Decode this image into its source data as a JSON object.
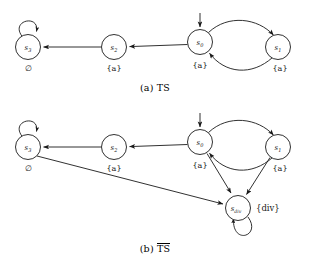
{
  "figure": {
    "title_a": "(a) TS",
    "caption_b_prefix": "(b) ",
    "caption_b_overlined": "TS",
    "stroke_color": "#1a1a1a",
    "background": "#ffffff"
  },
  "diagram_a": {
    "name": "TS",
    "caption": "(a) TS",
    "initial_state": "s0",
    "nodes": [
      {
        "id": "s3",
        "label_base": "s",
        "label_sub": "3",
        "ap": "∅",
        "ap_type": "emptyset",
        "cx": 28,
        "cy": 47,
        "r": 12.5
      },
      {
        "id": "s2",
        "label_base": "s",
        "label_sub": "2",
        "ap": "{a}",
        "ap_type": "set",
        "cx": 114,
        "cy": 47,
        "r": 12.5
      },
      {
        "id": "s0",
        "label_base": "s",
        "label_sub": "0",
        "ap": "{a}",
        "ap_type": "set",
        "cx": 200,
        "cy": 42,
        "r": 12.5
      },
      {
        "id": "s1",
        "label_base": "s",
        "label_sub": "1",
        "ap": "{a}",
        "ap_type": "set",
        "cx": 278,
        "cy": 47,
        "r": 12.5
      }
    ],
    "edges": [
      {
        "from": "s3",
        "to": "s3",
        "kind": "self-loop-top"
      },
      {
        "from": "s2",
        "to": "s3",
        "kind": "straight"
      },
      {
        "from": "s0",
        "to": "s2",
        "kind": "straight"
      },
      {
        "from": "s0",
        "to": "s1",
        "kind": "curve-above"
      },
      {
        "from": "s1",
        "to": "s0",
        "kind": "curve-below"
      }
    ],
    "initial_arrow": {
      "to": "s0",
      "from_above": true
    }
  },
  "diagram_b": {
    "name": "TS-bar",
    "caption": "(b) TS",
    "caption_has_overline": true,
    "initial_state": "s0",
    "nodes": [
      {
        "id": "s3",
        "label_base": "s",
        "label_sub": "3",
        "ap": "∅",
        "ap_type": "emptyset",
        "cx": 28,
        "cy": 147,
        "r": 12.5
      },
      {
        "id": "s2",
        "label_base": "s",
        "label_sub": "2",
        "ap": "{a}",
        "ap_type": "set",
        "cx": 114,
        "cy": 147,
        "r": 12.5
      },
      {
        "id": "s0",
        "label_base": "s",
        "label_sub": "0",
        "ap": "{a}",
        "ap_type": "set",
        "cx": 200,
        "cy": 142,
        "r": 12.5
      },
      {
        "id": "s1",
        "label_base": "s",
        "label_sub": "1",
        "ap": "{a}",
        "ap_type": "set",
        "cx": 278,
        "cy": 147,
        "r": 12.5
      },
      {
        "id": "sdiv",
        "label_base": "s",
        "label_sub": "div",
        "ap": "{div}",
        "ap_type": "set-right",
        "cx": 238,
        "cy": 208,
        "r": 12.5
      }
    ],
    "edges": [
      {
        "from": "s3",
        "to": "s3",
        "kind": "self-loop-top"
      },
      {
        "from": "s2",
        "to": "s3",
        "kind": "straight"
      },
      {
        "from": "s0",
        "to": "s2",
        "kind": "straight"
      },
      {
        "from": "s0",
        "to": "s1",
        "kind": "curve-above"
      },
      {
        "from": "s1",
        "to": "s0",
        "kind": "curve-below"
      },
      {
        "from": "s0",
        "to": "sdiv",
        "kind": "straight"
      },
      {
        "from": "s1",
        "to": "sdiv",
        "kind": "straight"
      },
      {
        "from": "s3",
        "to": "sdiv",
        "kind": "straight-long"
      },
      {
        "from": "sdiv",
        "to": "sdiv",
        "kind": "self-loop-bottom"
      }
    ],
    "initial_arrow": {
      "to": "s0",
      "from_above": true
    }
  }
}
